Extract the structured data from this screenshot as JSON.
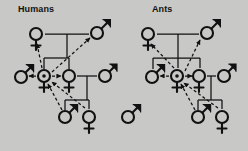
{
  "figure": {
    "type": "kinship-pedigree-diagram",
    "background_color": "#c8c8c6",
    "ink_color": "#111111",
    "width": 248,
    "height": 151
  },
  "panels": [
    {
      "id": "humans",
      "title": "Humans",
      "title_pos": {
        "x": 18,
        "y": 4
      },
      "nodes": [
        {
          "id": "h-mother",
          "symbol": "female",
          "label": "female-symbol",
          "x": 36,
          "y": 34
        },
        {
          "id": "h-father",
          "symbol": "male",
          "label": "male-symbol",
          "x": 97,
          "y": 33
        },
        {
          "id": "h-brother",
          "symbol": "male",
          "label": "male-symbol",
          "x": 21,
          "y": 77
        },
        {
          "id": "h-focal",
          "symbol": "female-focal",
          "label": "focal-female-symbol",
          "x": 44,
          "y": 76
        },
        {
          "id": "h-sister",
          "symbol": "female",
          "label": "female-symbol",
          "x": 69,
          "y": 76
        },
        {
          "id": "h-mate",
          "symbol": "male",
          "label": "male-symbol",
          "x": 105,
          "y": 76
        },
        {
          "id": "h-son",
          "symbol": "male",
          "label": "male-symbol",
          "x": 65,
          "y": 117
        },
        {
          "id": "h-daughter",
          "symbol": "female",
          "label": "female-symbol",
          "x": 89,
          "y": 117
        }
      ]
    },
    {
      "id": "ants",
      "title": "Ants",
      "title_pos": {
        "x": 152,
        "y": 4
      },
      "nodes": [
        {
          "id": "a-queen",
          "symbol": "female",
          "label": "female-symbol",
          "x": 148,
          "y": 34
        },
        {
          "id": "a-drone",
          "symbol": "male",
          "label": "male-symbol",
          "x": 207,
          "y": 33
        },
        {
          "id": "a-brother",
          "symbol": "male",
          "label": "male-symbol",
          "x": 152,
          "y": 77
        },
        {
          "id": "a-focal",
          "symbol": "female-focal",
          "label": "focal-female-symbol",
          "x": 177,
          "y": 76
        },
        {
          "id": "a-sister",
          "symbol": "female",
          "label": "female-symbol",
          "x": 199,
          "y": 76
        },
        {
          "id": "a-mate",
          "symbol": "male",
          "label": "male-symbol",
          "x": 224,
          "y": 76
        },
        {
          "id": "a-son",
          "symbol": "male",
          "label": "male-symbol",
          "x": 198,
          "y": 117
        },
        {
          "id": "a-daughter",
          "symbol": "female",
          "label": "female-symbol",
          "x": 222,
          "y": 117
        },
        {
          "id": "a-lone-male",
          "symbol": "male",
          "label": "male-symbol",
          "x": 128,
          "y": 117
        }
      ]
    }
  ],
  "legend_note": ""
}
